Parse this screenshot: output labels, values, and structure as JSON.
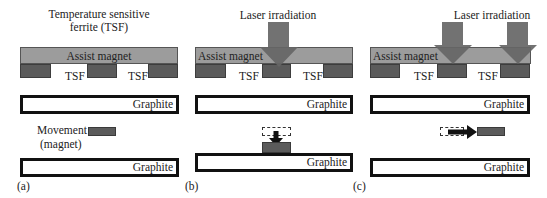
{
  "colors": {
    "assist_magnet": "#9c9c9c",
    "tsf_block": "#5b5b5b",
    "graphite_border": "#111111",
    "laser_arrow": "#666666",
    "background": "#ffffff"
  },
  "panels": [
    {
      "id": "a",
      "caption": "(a)",
      "title_line1": "Temperature sensitive",
      "title_line2": "ferrite (TSF)",
      "assist_magnet_label": "Assist magnet",
      "tsf_labels": [
        "TSF",
        "TSF"
      ],
      "graphite_top_label": "Graphite",
      "graphite_bottom_label": "Graphite",
      "movement_label_line1": "Movement",
      "movement_label_line2": "(magnet)"
    },
    {
      "id": "b",
      "caption": "(b)",
      "title": "Laser irradiation",
      "assist_magnet_label": "Assist magnet",
      "tsf_labels": [
        "TSF",
        "TSF"
      ],
      "graphite_top_label": "Graphite",
      "graphite_bottom_label": "Graphite"
    },
    {
      "id": "c",
      "caption": "(c)",
      "title": "Laser irradiation",
      "assist_magnet_label": "Assist magnet",
      "tsf_labels": [
        "TSF",
        "TSF"
      ],
      "graphite_top_label": "Graphite",
      "graphite_bottom_label": "Graphite"
    }
  ]
}
